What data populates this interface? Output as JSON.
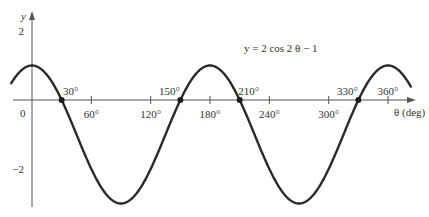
{
  "chart_data": {
    "type": "line",
    "title": "",
    "equation_label": "y = 2 cos 2 θ − 1",
    "xlabel": "θ (deg)",
    "ylabel": "y",
    "x_ticks": [
      {
        "value": 60,
        "label": "60°"
      },
      {
        "value": 120,
        "label": "120°"
      },
      {
        "value": 180,
        "label": "180°"
      },
      {
        "value": 240,
        "label": "240°"
      },
      {
        "value": 300,
        "label": "300°"
      },
      {
        "value": 360,
        "label": "360°"
      }
    ],
    "origin_label": "0",
    "y_ticks": [
      {
        "value": 2,
        "label": "2"
      },
      {
        "value": -2,
        "label": "−2"
      }
    ],
    "xlim": [
      -21,
      383
    ],
    "ylim": [
      -3,
      2.5
    ],
    "grid": false,
    "legend": null,
    "series": [
      {
        "name": "y = 2 cos 2θ − 1",
        "function": "2*cos(2*theta_deg*pi/180) - 1",
        "x": [
          -20,
          0,
          30,
          45,
          90,
          135,
          150,
          180,
          210,
          225,
          270,
          315,
          330,
          360,
          380
        ],
        "values": [
          0.53,
          1,
          0,
          -1,
          -3,
          -1,
          0,
          1,
          0,
          -1,
          -3,
          -1,
          0,
          1,
          0.53
        ]
      }
    ],
    "marked_points": [
      {
        "x": 30,
        "y": 0,
        "label": "30°"
      },
      {
        "x": 150,
        "y": 0,
        "label": "150°"
      },
      {
        "x": 210,
        "y": 0,
        "label": "210°"
      },
      {
        "x": 330,
        "y": 0,
        "label": "330°"
      }
    ],
    "annotations": [
      "y = 2 cos 2 θ − 1"
    ]
  },
  "plot": {
    "origin_px": [
      32,
      100
    ],
    "px_per_deg": 0.989,
    "px_per_unit": 34.5,
    "curve_color": "#2a2a2a",
    "axis_color": "#555555"
  }
}
